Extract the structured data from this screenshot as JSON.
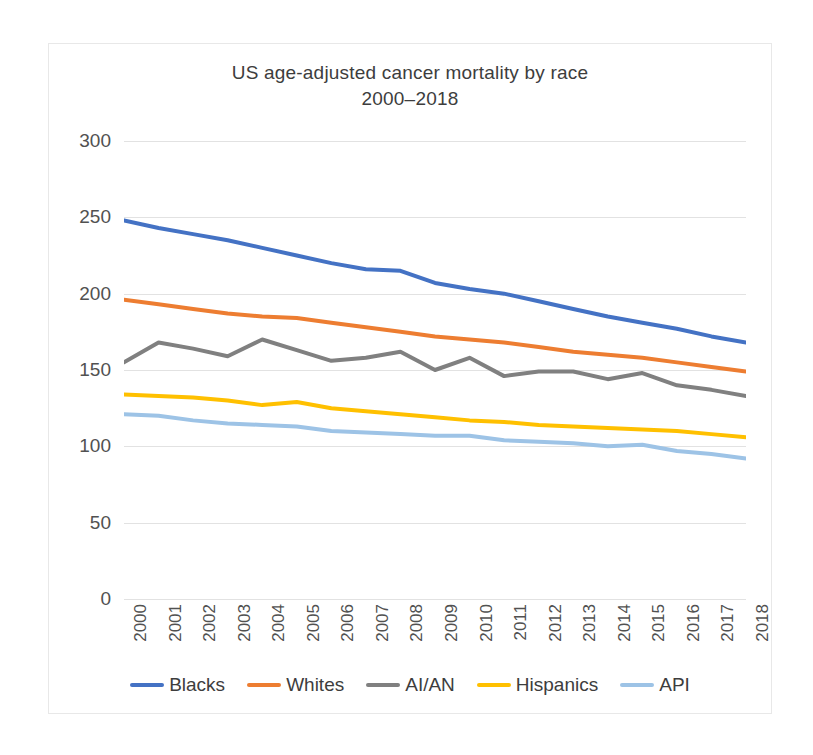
{
  "chart": {
    "title_line1": "US age-adjusted cancer mortality by race",
    "title_line2": "2000–2018",
    "background": "#ffffff",
    "border_color": "#e8e8e8",
    "gridline_color": "#e2e2e2"
  },
  "chart_data": {
    "type": "line",
    "title": "US age-adjusted cancer mortality by race 2000–2018",
    "xlabel": "",
    "ylabel": "",
    "ylim": [
      0,
      300
    ],
    "yticks": [
      0,
      50,
      100,
      150,
      200,
      250,
      300
    ],
    "grid": true,
    "legend_position": "bottom",
    "categories": [
      "2000",
      "2001",
      "2002",
      "2003",
      "2004",
      "2005",
      "2006",
      "2007",
      "2008",
      "2009",
      "2010",
      "2011",
      "2012",
      "2013",
      "2014",
      "2015",
      "2016",
      "2017",
      "2018"
    ],
    "series": [
      {
        "name": "Blacks",
        "color": "#4472c4",
        "values": [
          248,
          243,
          239,
          235,
          230,
          225,
          220,
          216,
          215,
          207,
          203,
          200,
          195,
          190,
          185,
          181,
          177,
          172,
          168
        ]
      },
      {
        "name": "Whites",
        "color": "#ed7d31",
        "values": [
          196,
          193,
          190,
          187,
          185,
          184,
          181,
          178,
          175,
          172,
          170,
          168,
          165,
          162,
          160,
          158,
          155,
          152,
          149
        ]
      },
      {
        "name": "AI/AN",
        "color": "#808080",
        "values": [
          155,
          168,
          164,
          159,
          170,
          163,
          156,
          158,
          162,
          150,
          158,
          146,
          149,
          149,
          144,
          148,
          140,
          137,
          133
        ]
      },
      {
        "name": "Hispanics",
        "color": "#ffc000",
        "values": [
          134,
          133,
          132,
          130,
          127,
          129,
          125,
          123,
          121,
          119,
          117,
          116,
          114,
          113,
          112,
          111,
          110,
          108,
          106
        ]
      },
      {
        "name": "API",
        "color": "#9dc3e6",
        "values": [
          121,
          120,
          117,
          115,
          114,
          113,
          110,
          109,
          108,
          107,
          107,
          104,
          103,
          102,
          100,
          101,
          97,
          95,
          92
        ]
      }
    ]
  },
  "legend": {
    "items": [
      {
        "label": "Blacks",
        "color": "#4472c4"
      },
      {
        "label": "Whites",
        "color": "#ed7d31"
      },
      {
        "label": "AI/AN",
        "color": "#808080"
      },
      {
        "label": "Hispanics",
        "color": "#ffc000"
      },
      {
        "label": "API",
        "color": "#9dc3e6"
      }
    ]
  }
}
